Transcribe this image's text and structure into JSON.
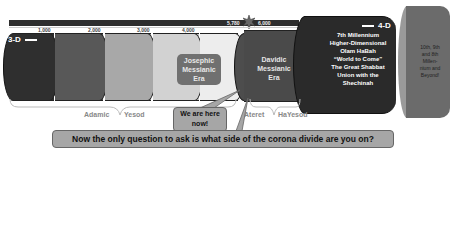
{
  "timeline": {
    "ticks": [
      "1,000",
      "2,000",
      "3,000",
      "4,000"
    ],
    "marker_left": "5,780",
    "marker_right": "6,000"
  },
  "dimensions": {
    "left": "3-D",
    "right": "4-D"
  },
  "eras": {
    "josephic": [
      "Josephic",
      "Messianic",
      "Era"
    ],
    "corona": "Corona",
    "davidic": [
      "Davidic",
      "Messianic",
      "Era"
    ]
  },
  "millennium": {
    "lines": [
      "7th Millennium",
      "Higher-Dimensional",
      "Olam HaBah",
      "“World to Come”",
      "The Great Shabbat",
      "Union with the",
      "Shechinah"
    ]
  },
  "outer": {
    "lines": [
      "10th, 9th",
      "and 8th",
      "Millen-",
      "nium and",
      "Beyond!"
    ]
  },
  "braces": {
    "left": [
      "Adamic",
      "Yesod"
    ],
    "right": [
      "Ateret",
      "HaYesod"
    ]
  },
  "callouts": {
    "here": "We are here now!",
    "question": "Now the only question to ask is what side of the corona divide are you on?"
  },
  "colors": {
    "seg1": "#2f2f2f",
    "seg2": "#585858",
    "seg3": "#a8a8a8",
    "seg4": "#d2d2d2",
    "seg5": "#ededed",
    "davidic": "#4a4a4a",
    "millennium": "#2a2a2a",
    "outer": "#6b6b6b",
    "callout": "#a6a6a6",
    "era_box": "#707070"
  }
}
